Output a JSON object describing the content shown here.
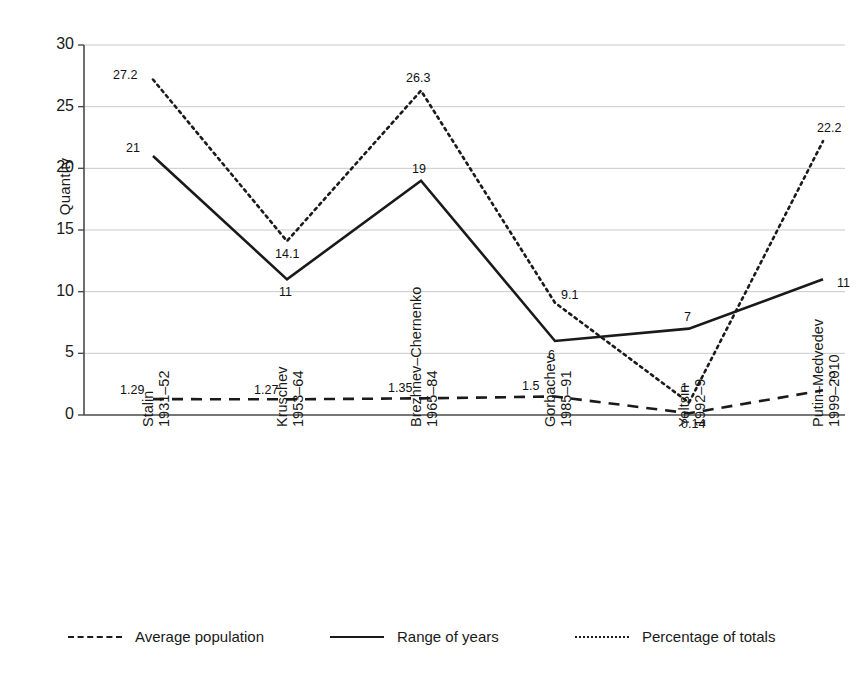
{
  "chart_data": {
    "type": "line",
    "title": "",
    "xlabel": "",
    "ylabel": "Quantity",
    "ylim": [
      0,
      30
    ],
    "yticks": [
      "0",
      "5",
      "10",
      "15",
      "20",
      "25",
      "30"
    ],
    "grid": true,
    "legend_position": "bottom",
    "categories": [
      {
        "name": "Stalin",
        "years": "1931–52"
      },
      {
        "name": "Kruschev",
        "years": "1953–64"
      },
      {
        "name": "Brezhnev–Chernenko",
        "years": "1965–84"
      },
      {
        "name": "Gorbachev",
        "years": "1985–91"
      },
      {
        "name": "Yeltsin",
        "years": "1992–9"
      },
      {
        "name": "Putin–Medvedev",
        "years": "1999–2010"
      }
    ],
    "series": [
      {
        "name": "Average population",
        "style": "dashed",
        "color": "#1a1a1a",
        "values": [
          1.29,
          1.27,
          1.35,
          1.5,
          0.14,
          2
        ],
        "labels": [
          "1.29",
          "1.27",
          "1.35",
          "1.5",
          "0.14",
          "2"
        ]
      },
      {
        "name": "Range of years",
        "style": "solid",
        "color": "#1a1a1a",
        "values": [
          21,
          11,
          19,
          6,
          7,
          11
        ],
        "labels": [
          "21",
          "11",
          "19",
          "6",
          "7",
          "11"
        ]
      },
      {
        "name": "Percentage of totals",
        "style": "dotted",
        "color": "#1a1a1a",
        "values": [
          27.2,
          14.1,
          26.3,
          9.1,
          1,
          22.2
        ],
        "labels": [
          "27.2",
          "14.1",
          "26.3",
          "9.1",
          "1",
          "22.2"
        ]
      }
    ]
  },
  "legend": {
    "items": [
      {
        "label": "Average population",
        "style": "dashed"
      },
      {
        "label": "Range of years",
        "style": "solid"
      },
      {
        "label": "Percentage of totals",
        "style": "dotted"
      }
    ]
  }
}
